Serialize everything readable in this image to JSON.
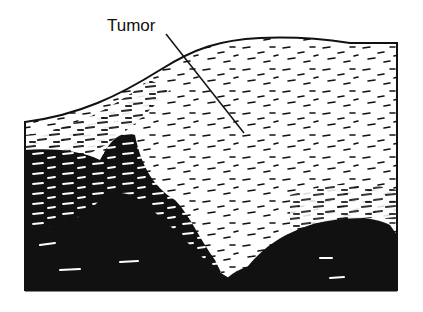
{
  "figure": {
    "type": "ultrasound-style tissue cross-section illustration",
    "background_color": "#ffffff",
    "ink_color": "#111111",
    "annotation": {
      "label": "Tumor",
      "label_position": {
        "x": 107,
        "y": 17
      },
      "leader_line": {
        "x1": 166,
        "y1": 34,
        "x2": 244,
        "y2": 133
      }
    },
    "outline": {
      "left_edge_x": 25,
      "right_edge_x": 397,
      "top_left_y": 122,
      "top_right_y": 42,
      "bottom_y": 291
    },
    "regions": [
      {
        "name": "tumor-region",
        "description": "lightly speckled hyperechoic area",
        "center": {
          "x": 260,
          "y": 150
        }
      },
      {
        "name": "dark-region-left",
        "description": "dense dark shadowing, lower left"
      },
      {
        "name": "dark-region-right",
        "description": "dense dark mass, lower right"
      }
    ]
  }
}
